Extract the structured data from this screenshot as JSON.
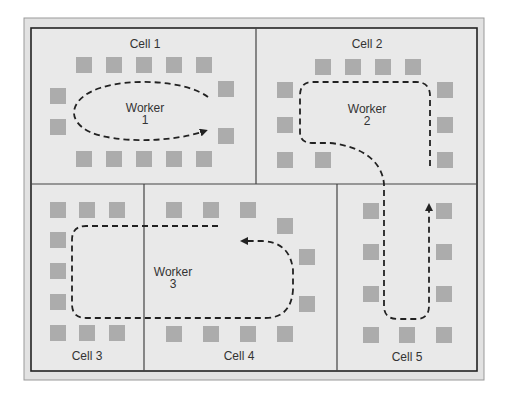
{
  "colors": {
    "page_bg": "#ffffff",
    "frame_bg": "#e4e4e4",
    "cell_bg": "#e9e9e9",
    "border": "#222222",
    "divider": "#444444",
    "station": "#acacac",
    "path": "#222222",
    "text": "#333333"
  },
  "cells": [
    {
      "id": "cell-1",
      "label": "Cell 1"
    },
    {
      "id": "cell-2",
      "label": "Cell 2"
    },
    {
      "id": "cell-3",
      "label": "Cell 3"
    },
    {
      "id": "cell-4",
      "label": "Cell 4"
    },
    {
      "id": "cell-5",
      "label": "Cell 5"
    }
  ],
  "workers": [
    {
      "id": "worker-1",
      "line1": "Worker",
      "line2": "1"
    },
    {
      "id": "worker-2",
      "line1": "Worker",
      "line2": "2"
    },
    {
      "id": "worker-3",
      "line1": "Worker",
      "line2": "3"
    }
  ]
}
